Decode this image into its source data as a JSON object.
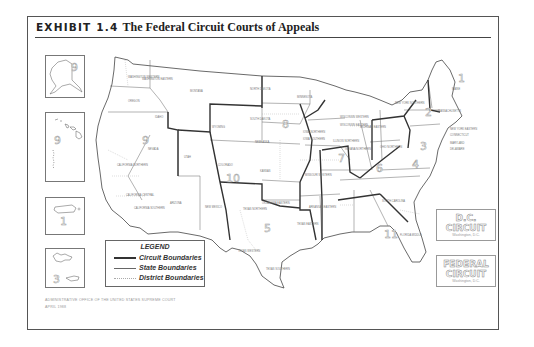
{
  "exhibit": {
    "label": "EXHIBIT 1.4",
    "title": "The Federal Circuit Courts of Appeals"
  },
  "legend": {
    "title": "LEGEND",
    "items": [
      {
        "label": "Circuit Boundaries",
        "style": "thick"
      },
      {
        "label": "State Boundaries",
        "style": "thin"
      },
      {
        "label": "District Boundaries",
        "style": "dotted"
      }
    ]
  },
  "special_circuits": [
    {
      "name_line1": "D.C.",
      "name_line2": "CIRCUIT",
      "location": "Washington, D.C."
    },
    {
      "name_line1": "FEDERAL",
      "name_line2": "CIRCUIT",
      "location": "Washington, D.C."
    }
  ],
  "insets": [
    {
      "name": "ALASKA",
      "circuit": "9"
    },
    {
      "name": "HAWAII",
      "circuit": "9",
      "extra": [
        "NORTHERN MARIANA ISLANDS",
        "GUAM"
      ]
    },
    {
      "name": "PUERTO RICO",
      "circuit": "1"
    },
    {
      "name": "VIRGIN ISLANDS",
      "circuit": "3"
    }
  ],
  "circuit_numbers": [
    "1",
    "2",
    "3",
    "4",
    "5",
    "6",
    "7",
    "8",
    "9",
    "10",
    "11"
  ],
  "state_labels": [
    "WASHINGTON WESTERN",
    "WASHINGTON EASTERN",
    "OREGON",
    "IDAHO",
    "MONTANA",
    "WYOMING",
    "NEVADA",
    "UTAH",
    "COLORADO",
    "ARIZONA",
    "NEW MEXICO",
    "CALIFORNIA NORTHERN",
    "CALIFORNIA EASTERN",
    "CALIFORNIA CENTRAL",
    "CALIFORNIA SOUTHERN",
    "NORTH DAKOTA",
    "SOUTH DAKOTA",
    "NEBRASKA",
    "KANSAS",
    "MINNESOTA",
    "IOWA NORTHERN",
    "IOWA SOUTHERN",
    "MISSOURI WESTERN",
    "MISSOURI EASTERN",
    "OKLAHOMA WESTERN",
    "OKLAHOMA NORTHERN",
    "OKLAHOMA EASTERN",
    "TEXAS NORTHERN",
    "TEXAS EASTERN",
    "TEXAS WESTERN",
    "TEXAS SOUTHERN",
    "ARKANSAS WESTERN",
    "ARKANSAS EASTERN",
    "LOUISIANA WESTERN",
    "LOUISIANA MIDDLE",
    "LOUISIANA EASTERN",
    "MISSISSIPPI NORTHERN",
    "MISSISSIPPI SOUTHERN",
    "WISCONSIN WESTERN",
    "WISCONSIN EASTERN",
    "ILLINOIS NORTHERN",
    "ILLINOIS CENTRAL",
    "ILLINOIS SOUTHERN",
    "INDIANA NORTHERN",
    "INDIANA SOUTHERN",
    "MICHIGAN WESTERN",
    "MICHIGAN EASTERN",
    "OHIO NORTHERN",
    "OHIO SOUTHERN",
    "KENTUCKY WESTERN",
    "KENTUCKY EASTERN",
    "TENNESSEE WESTERN",
    "TENNESSEE MIDDLE",
    "TENNESSEE EASTERN",
    "ALABAMA NORTHERN",
    "ALABAMA MIDDLE",
    "ALABAMA SOUTHERN",
    "GEORGIA NORTHERN",
    "GEORGIA MIDDLE",
    "GEORGIA SOUTHERN",
    "FLORIDA NORTHERN",
    "FLORIDA MIDDLE",
    "FLORIDA SOUTHERN",
    "SOUTH CAROLINA",
    "NORTH CAROLINA WESTERN",
    "NORTH CAROLINA MIDDLE",
    "NORTH CAROLINA EASTERN",
    "VIRGINIA WESTERN",
    "VIRGINIA EASTERN",
    "WEST VIRGINIA NORTHERN",
    "WEST VIRGINIA SOUTHERN",
    "PENNSYLVANIA WESTERN",
    "PENNSYLVANIA MIDDLE",
    "PENNSYLVANIA EASTERN",
    "NEW YORK WESTERN",
    "NEW YORK NORTHERN",
    "NEW YORK SOUTHERN",
    "NEW YORK EASTERN",
    "VERMONT",
    "NEW HAMPSHIRE",
    "MASSACHUSETTS",
    "RHODE ISLAND",
    "CONNECTICUT",
    "NEW JERSEY",
    "DELAWARE",
    "MARYLAND",
    "DISTRICT OF COLUMBIA",
    "MAINE"
  ],
  "footer": {
    "source": "ADMINISTRATIVE OFFICE OF THE UNITED STATES SUPREME COURT",
    "date": "APRIL 1988"
  }
}
